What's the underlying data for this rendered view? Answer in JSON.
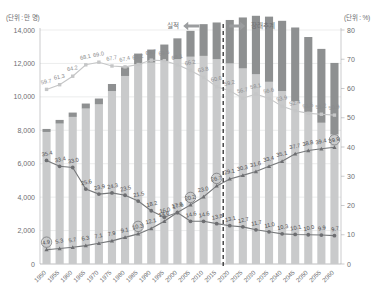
{
  "units": {
    "left": "(단위 : 만 명)",
    "right": "(단위 : %)"
  },
  "legend": {
    "actual_label": "실적",
    "projection_label": "장래추계",
    "left_arrow_icon": "arrow-left-icon",
    "right_arrow_icon": "arrow-right-icon",
    "divider_year": "2015"
  },
  "axes": {
    "left_ticks": [
      "0",
      "2,000",
      "4,000",
      "6,000",
      "8,000",
      "10,000",
      "12,000",
      "14,000"
    ],
    "right_ticks": [
      "0",
      "10",
      "20",
      "30",
      "40",
      "50",
      "60",
      "70",
      "80"
    ]
  },
  "chart_data": {
    "type": "bar",
    "title": "",
    "xlabel": "",
    "ylabel": "만 명",
    "ylim": [
      0,
      14000
    ],
    "y2lim": [
      0,
      80
    ],
    "grid": true,
    "legend_position": "top-center",
    "categories": [
      "1950",
      "1955",
      "1960",
      "1965",
      "1970",
      "1975",
      "1980",
      "1985",
      "1990",
      "1995",
      "2000",
      "2005",
      "2010",
      "2015",
      "2020",
      "2025",
      "2030",
      "2035",
      "2040",
      "2045",
      "2050",
      "2055",
      "2060"
    ],
    "bars": {
      "name": "총인구",
      "stack": [
        {
          "name": "생산가능·유소년 인구",
          "values": [
            7900,
            8400,
            8800,
            9300,
            9550,
            10350,
            11250,
            11950,
            12050,
            12150,
            12250,
            12400,
            12450,
            12250,
            12000,
            11700,
            11350,
            10900,
            10350,
            9750,
            9100,
            8450,
            7750
          ]
        },
        {
          "name": "고령 인구",
          "values": [
            180,
            220,
            260,
            300,
            350,
            420,
            520,
            640,
            780,
            980,
            1250,
            1550,
            1900,
            2200,
            2600,
            3050,
            3500,
            3900,
            4200,
            4400,
            4480,
            4420,
            4280
          ]
        }
      ],
      "totals": [
        8100,
        8620,
        9060,
        9600,
        9900,
        10770,
        11770,
        12590,
        12830,
        13130,
        13500,
        13950,
        14350,
        14450,
        14600,
        14750,
        14850,
        14800,
        14550,
        14150,
        13580,
        12870,
        12030
      ]
    },
    "lines": [
      {
        "name": "생산가능인구 비중",
        "axis": "right",
        "style": "light",
        "values": [
          59.7,
          61.3,
          64.2,
          68.1,
          69.0,
          67.7,
          67.4,
          68.2,
          69.7,
          69.5,
          68.1,
          66.2,
          63.8,
          60.6,
          59.2,
          56.7,
          58.1,
          56.6,
          53.9,
          52.4,
          51.5,
          51.2,
          50.9
        ],
        "labels": [
          "59.7",
          "61.3",
          "64.2",
          "68.1",
          "69.0",
          "67.7",
          "67.4",
          "68.2",
          "69.7",
          "69.5",
          "68.1",
          "66.2",
          "63.8",
          "60.6",
          "59.2",
          "56.7",
          "58.1",
          "56.6",
          "53.9",
          "52.4",
          "51.5",
          "51.2",
          "50.9"
        ]
      },
      {
        "name": "유소년인구 비중",
        "axis": "right",
        "style": "dark",
        "values": [
          35.4,
          33.4,
          33.0,
          25.6,
          23.9,
          24.3,
          23.5,
          21.5,
          18.2,
          16.0,
          17.6,
          14.6,
          14.6,
          13.8,
          13.1,
          12.7,
          11.7,
          11.0,
          10.3,
          10.1,
          10.0,
          9.9,
          9.7,
          9.4,
          9.1
        ],
        "labels": [
          "35.4",
          "33.4",
          "33.0",
          "25.6",
          "23.9",
          "24.3",
          "23.5",
          "21.5",
          "18.2",
          "16.0",
          "17.6",
          "14.6",
          "14.6",
          "13.8",
          "13.1",
          "12.7",
          "11.7",
          "11.0",
          "10.3",
          "10.1",
          "10.0",
          "9.9",
          "9.7",
          "9.4",
          "9.1"
        ]
      },
      {
        "name": "고령인구 비중",
        "axis": "right",
        "style": "dark",
        "values": [
          4.9,
          5.3,
          5.7,
          6.3,
          7.1,
          7.9,
          9.1,
          10.3,
          12.1,
          14.6,
          17.6,
          20.2,
          23.0,
          26.7,
          29.1,
          30.3,
          31.6,
          33.4,
          35.1,
          37.7,
          38.8,
          39.4,
          39.9
        ],
        "labels": [
          "4.9",
          "5.3",
          "5.7",
          "6.3",
          "7.1",
          "7.9",
          "9.1",
          "10.3",
          "12.1",
          "14.6",
          "17.6",
          "20.2",
          "23.0",
          "26.7",
          "29.1",
          "30.3",
          "31.6",
          "33.4",
          "35.1",
          "37.7",
          "38.8",
          "39.4",
          "39.9"
        ],
        "highlighted": [
          "4.9",
          "10.3",
          "20.2",
          "26.7",
          "39.9"
        ]
      }
    ]
  }
}
